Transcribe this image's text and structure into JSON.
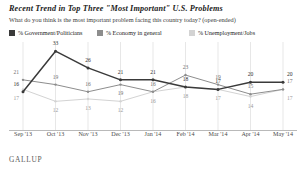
{
  "header": {
    "title": "Recent Trend in Top Three \"Most Important\" U.S. Problems",
    "subtitle": "What do you think is the most important problem facing this country today? (open-ended)"
  },
  "legend": [
    {
      "label": "% Government/Politicians",
      "color": "#3a3a3a",
      "swatch_name": "legend-swatch-government"
    },
    {
      "label": "% Economy in general",
      "color": "#8d8d8d",
      "swatch_name": "legend-swatch-economy"
    },
    {
      "label": "% Unemployment/Jobs",
      "color": "#d3d3d3",
      "swatch_name": "legend-swatch-unemployment"
    }
  ],
  "footer": {
    "brand": "GALLUP"
  },
  "chart_data": {
    "type": "line",
    "title": "Recent Trend in Top Three \"Most Important\" U.S. Problems",
    "subtitle": "What do you think is the most important problem facing this country today? (open-ended)",
    "xlabel": "",
    "ylabel": "",
    "ylim": [
      0,
      36
    ],
    "grid": "vertical",
    "legend_position": "top",
    "categories": [
      "Sep '13",
      "Oct '13",
      "Nov '13",
      "Dec '13",
      "Jan '14",
      "Feb '14",
      "Mar '14",
      "Apr '14",
      "May '14"
    ],
    "series": [
      {
        "name": "% Government/Politicians",
        "color": "#3a3a3a",
        "values": [
          16,
          33,
          26,
          21,
          21,
          18,
          17,
          20,
          20
        ]
      },
      {
        "name": "% Economy in general",
        "color": "#8d8d8d",
        "values": [
          21,
          19,
          16,
          19,
          16,
          23,
          19,
          15,
          17
        ]
      },
      {
        "name": "% Unemployment/Jobs",
        "color": "#d3d3d3",
        "values": [
          17,
          12,
          13,
          12,
          16,
          18,
          17,
          14,
          17
        ]
      }
    ]
  }
}
